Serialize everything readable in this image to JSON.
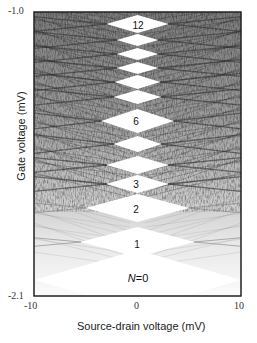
{
  "chart_data": {
    "type": "heatmap",
    "title": "",
    "xlabel": "Source-drain voltage (mV)",
    "ylabel": "Gate voltage (mV)",
    "xlim": [
      -10,
      10
    ],
    "ylim": [
      -2.1,
      -1.0
    ],
    "x_ticks": [
      "-10",
      "0",
      "10"
    ],
    "y_ticks": [
      "-1.0",
      "-2.1"
    ],
    "colormap": "grayscale (white = low conductance, dark = high differential conductance)",
    "grid": false,
    "legend": null,
    "annotations": [
      {
        "text": "12",
        "N": 12
      },
      {
        "text": "6",
        "N": 6
      },
      {
        "text": "3",
        "N": 3
      },
      {
        "text": "2",
        "N": 2
      },
      {
        "text": "1",
        "N": 1
      },
      {
        "text": "N=0",
        "N": 0
      }
    ],
    "diamonds": [
      {
        "N": 0,
        "center_y_px": 280,
        "half_width_mV": 10.0,
        "half_height_px": 30
      },
      {
        "N": 1,
        "center_y_px": 242,
        "half_width_mV": 5.5,
        "half_height_px": 15
      },
      {
        "N": 2,
        "center_y_px": 208,
        "half_width_mV": 5.0,
        "half_height_px": 14
      },
      {
        "N": 3,
        "center_y_px": 184,
        "half_width_mV": 3.0,
        "half_height_px": 9
      },
      {
        "N": 4,
        "center_y_px": 165,
        "half_width_mV": 3.0,
        "half_height_px": 9
      },
      {
        "N": 5,
        "center_y_px": 144,
        "half_width_mV": 2.3,
        "half_height_px": 8
      },
      {
        "N": 6,
        "center_y_px": 121,
        "half_width_mV": 3.5,
        "half_height_px": 12
      },
      {
        "N": 7,
        "center_y_px": 97,
        "half_width_mV": 2.3,
        "half_height_px": 7
      },
      {
        "N": 8,
        "center_y_px": 82,
        "half_width_mV": 2.2,
        "half_height_px": 7
      },
      {
        "N": 9,
        "center_y_px": 68,
        "half_width_mV": 2.0,
        "half_height_px": 6
      },
      {
        "N": 10,
        "center_y_px": 54,
        "half_width_mV": 2.0,
        "half_height_px": 6
      },
      {
        "N": 11,
        "center_y_px": 40,
        "half_width_mV": 2.0,
        "half_height_px": 6
      },
      {
        "N": 12,
        "center_y_px": 24,
        "half_width_mV": 3.0,
        "half_height_px": 9
      }
    ]
  },
  "labels": {
    "d12": "12",
    "d6": "6",
    "d3": "3",
    "d2": "2",
    "d1": "1",
    "n0_var": "N",
    "n0_val": "=0"
  }
}
